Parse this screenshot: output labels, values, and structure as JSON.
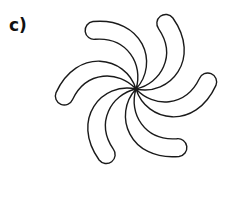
{
  "figure": {
    "panel_label": "c)",
    "arm_count": 6,
    "colors": {
      "stroke": "#1a1a1a",
      "fill": "#ffffff",
      "background": "#ffffff"
    }
  }
}
